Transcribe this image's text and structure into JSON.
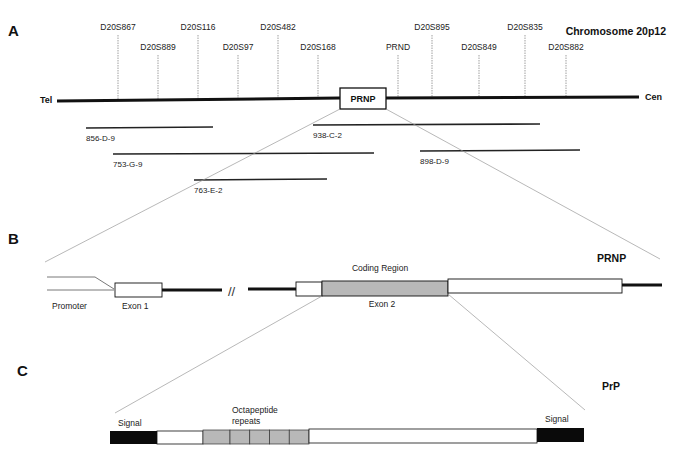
{
  "panels": {
    "A": {
      "letter": "A",
      "title": "Chromosome 20p12",
      "tel_label": "Tel",
      "cen_label": "Cen",
      "gene_box": "PRNP",
      "markers": [
        {
          "name": "D20S867",
          "x": 118,
          "top": 27
        },
        {
          "name": "D20S889",
          "x": 158,
          "top": 47
        },
        {
          "name": "D20S116",
          "x": 198,
          "top": 27
        },
        {
          "name": "D20S97",
          "x": 238,
          "top": 47
        },
        {
          "name": "D20S482",
          "x": 278,
          "top": 27
        },
        {
          "name": "D20S168",
          "x": 318,
          "top": 47
        },
        {
          "name": "PRND",
          "x": 398,
          "top": 47
        },
        {
          "name": "D20S895",
          "x": 432,
          "top": 27
        },
        {
          "name": "D20S849",
          "x": 479,
          "top": 47
        },
        {
          "name": "D20S835",
          "x": 525,
          "top": 27
        },
        {
          "name": "D20S882",
          "x": 566,
          "top": 47
        }
      ],
      "clones": [
        {
          "name": "856-D-9",
          "x1": 86,
          "x2": 213,
          "y": 128
        },
        {
          "name": "938-C-2",
          "x1": 313,
          "x2": 540,
          "y": 125
        },
        {
          "name": "753-G-9",
          "x1": 113,
          "x2": 374,
          "y": 154
        },
        {
          "name": "898-D-9",
          "x1": 420,
          "x2": 580,
          "y": 151
        },
        {
          "name": "763-E-2",
          "x1": 194,
          "x2": 327,
          "y": 180
        }
      ]
    },
    "B": {
      "letter": "B",
      "title": "PRNP",
      "coding_region_label": "Coding Region",
      "promoter_label": "Promoter",
      "exon1_label": "Exon 1",
      "exon2_label": "Exon 2",
      "break_symbol": "//"
    },
    "C": {
      "letter": "C",
      "title": "PrP",
      "signal_left_label": "Signal",
      "signal_right_label": "Signal",
      "octapeptide_label_line1": "Octapeptide",
      "octapeptide_label_line2": "repeats",
      "octapeptide_repeat_count": 5
    }
  },
  "colors": {
    "line": "#111111",
    "shaded": "#b8b8b8",
    "signal": "#0a0a0a",
    "guide": "#9a9a9a"
  }
}
